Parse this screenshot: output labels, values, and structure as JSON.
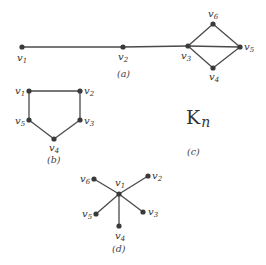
{
  "figure": {
    "panels": [
      {
        "id": "a",
        "caption": "(a)",
        "vertices": [
          {
            "name": "v",
            "sub": "1",
            "x": 22,
            "y": 47
          },
          {
            "name": "v",
            "sub": "2",
            "x": 123,
            "y": 47
          },
          {
            "name": "v",
            "sub": "3",
            "x": 188,
            "y": 46
          },
          {
            "name": "v",
            "sub": "4",
            "x": 213,
            "y": 68
          },
          {
            "name": "v",
            "sub": "5",
            "x": 240,
            "y": 47
          },
          {
            "name": "v",
            "sub": "6",
            "x": 213,
            "y": 24
          }
        ],
        "edges": [
          [
            "v1",
            "v2"
          ],
          [
            "v2",
            "v3"
          ],
          [
            "v3",
            "v6"
          ],
          [
            "v6",
            "v5"
          ],
          [
            "v3",
            "v5"
          ],
          [
            "v3",
            "v4"
          ],
          [
            "v4",
            "v5"
          ]
        ]
      },
      {
        "id": "b",
        "caption": "(b)",
        "vertices": [
          {
            "name": "v",
            "sub": "1",
            "x": 29,
            "y": 91
          },
          {
            "name": "v",
            "sub": "2",
            "x": 80,
            "y": 91
          },
          {
            "name": "v",
            "sub": "3",
            "x": 80,
            "y": 120
          },
          {
            "name": "v",
            "sub": "4",
            "x": 54,
            "y": 139
          },
          {
            "name": "v",
            "sub": "5",
            "x": 29,
            "y": 120
          }
        ],
        "edges": [
          [
            "v1",
            "v2"
          ],
          [
            "v2",
            "v3"
          ],
          [
            "v3",
            "v4"
          ],
          [
            "v4",
            "v5"
          ],
          [
            "v5",
            "v1"
          ]
        ]
      },
      {
        "id": "c",
        "caption": "(c)",
        "label": "K",
        "label_sub": "n"
      },
      {
        "id": "d",
        "caption": "(d)",
        "vertices": [
          {
            "name": "v",
            "sub": "1",
            "x": 119,
            "y": 194
          },
          {
            "name": "v",
            "sub": "2",
            "x": 148,
            "y": 176
          },
          {
            "name": "v",
            "sub": "3",
            "x": 143,
            "y": 212
          },
          {
            "name": "v",
            "sub": "4",
            "x": 119,
            "y": 226
          },
          {
            "name": "v",
            "sub": "5",
            "x": 96,
            "y": 214
          },
          {
            "name": "v",
            "sub": "6",
            "x": 94,
            "y": 179
          }
        ],
        "edges": [
          [
            "v1",
            "v2"
          ],
          [
            "v1",
            "v3"
          ],
          [
            "v1",
            "v4"
          ],
          [
            "v1",
            "v5"
          ],
          [
            "v1",
            "v6"
          ]
        ]
      }
    ]
  }
}
